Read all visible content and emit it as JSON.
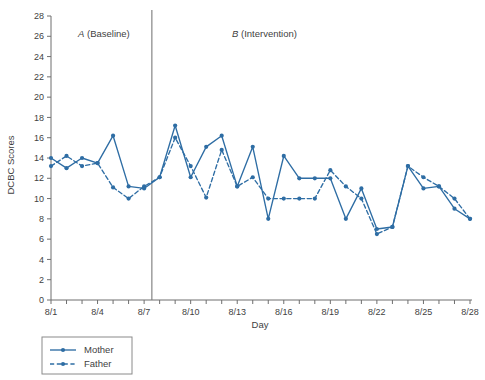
{
  "chart_data": {
    "type": "line",
    "title": "",
    "xlabel": "Day",
    "ylabel": "DCBC Scores",
    "ylim": [
      0,
      28
    ],
    "ytick_step": 2,
    "yticks": [
      0,
      2,
      4,
      6,
      8,
      10,
      12,
      14,
      16,
      18,
      20,
      22,
      24,
      26,
      28
    ],
    "x": [
      "8/1",
      "8/2",
      "8/3",
      "8/4",
      "8/5",
      "8/6",
      "8/7",
      "8/8",
      "8/9",
      "8/10",
      "8/11",
      "8/12",
      "8/13",
      "8/14",
      "8/15",
      "8/16",
      "8/17",
      "8/18",
      "8/19",
      "8/20",
      "8/21",
      "8/22",
      "8/23",
      "8/24",
      "8/25",
      "8/26",
      "8/27",
      "8/28"
    ],
    "xtick_labels": [
      "8/1",
      "8/4",
      "8/7",
      "8/10",
      "8/13",
      "8/16",
      "8/19",
      "8/22",
      "8/25",
      "8/28"
    ],
    "xtick_label_indices": [
      0,
      3,
      6,
      9,
      12,
      15,
      18,
      21,
      24,
      27
    ],
    "grid": false,
    "legend_position": "below-left",
    "accent_color": "#2e6da4",
    "series": [
      {
        "name": "Mother",
        "style": "solid",
        "color": "#2e6da4",
        "values": [
          14,
          13,
          14,
          13.5,
          16.2,
          11.2,
          11,
          12.1,
          17.2,
          12.1,
          15.1,
          16.2,
          11.2,
          15.1,
          8,
          14.2,
          12,
          12,
          12,
          8,
          11,
          7,
          7.2,
          13.2,
          11,
          11.2,
          9,
          8
        ]
      },
      {
        "name": "Father",
        "style": "dashed",
        "color": "#2e6da4",
        "values": [
          13.2,
          14.2,
          13.2,
          13.5,
          11.1,
          10,
          11.2,
          12.1,
          16,
          13.2,
          10.1,
          14.8,
          11.2,
          12.1,
          10,
          10,
          10,
          10,
          12.8,
          11.2,
          10,
          6.5,
          7.2,
          13.2,
          12.1,
          11.2,
          10,
          8
        ]
      }
    ]
  },
  "annotations": {
    "phase_a_label_italic": "A",
    "phase_a_label_rest": " (Baseline)",
    "phase_b_label_italic": "B",
    "phase_b_label_rest": " (Intervention)",
    "divider_after_index": 6
  },
  "legend": {
    "items": [
      {
        "label": "Mother",
        "style": "solid"
      },
      {
        "label": "Father",
        "style": "dashed"
      }
    ]
  }
}
